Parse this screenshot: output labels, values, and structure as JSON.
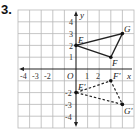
{
  "problem": {
    "number": "3."
  },
  "graph": {
    "x_axis_label": "x",
    "y_axis_label": "y",
    "origin_label": "O",
    "x_tick_labels": [
      "-4",
      "-3",
      "-2",
      "1",
      "2"
    ],
    "y_tick_labels": [
      "4",
      "3",
      "2",
      "1",
      "-2",
      "-3",
      "-4"
    ],
    "grid": {
      "x_min": -5,
      "x_max": 5,
      "y_min": -5,
      "y_max": 5,
      "line_color": "#b8b8b8"
    },
    "original_triangle": {
      "style": "solid",
      "vertices": [
        {
          "label": "E",
          "x": 0,
          "y": 2
        },
        {
          "label": "F",
          "x": 3,
          "y": 1
        },
        {
          "label": "G",
          "x": 4,
          "y": 3
        }
      ]
    },
    "image_triangle": {
      "style": "dashed",
      "vertices": [
        {
          "label": "E'",
          "x": 0,
          "y": -2
        },
        {
          "label": "F'",
          "x": 3,
          "y": -1
        },
        {
          "label": "G'",
          "x": 4,
          "y": -3
        }
      ]
    }
  }
}
